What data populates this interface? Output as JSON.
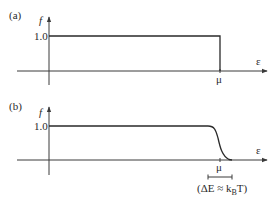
{
  "figure": {
    "panels": [
      {
        "id": "a",
        "label": "(a)",
        "y_axis_label": "f",
        "x_axis_label": "ε",
        "y_tick": "1.0",
        "x_tick": "μ",
        "curve": "step function: f = 1.0 for ε < μ, f = 0 for ε > μ"
      },
      {
        "id": "b",
        "label": "(b)",
        "y_axis_label": "f",
        "x_axis_label": "ε",
        "y_tick": "1.0",
        "x_tick": "μ",
        "curve": "smoothed step: f = 1.0 far below μ, falls smoothly to 0 around μ",
        "annotation": {
          "prefix": "(ΔE ≈ k",
          "subscript": "B",
          "suffix": "T)"
        }
      }
    ]
  },
  "colors": {
    "line": "#2a2a2a",
    "background": "#ffffff"
  }
}
